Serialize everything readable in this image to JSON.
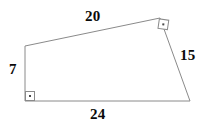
{
  "figure": {
    "kind": "quadrilateral-diagram",
    "canvas": {
      "width": 206,
      "height": 127,
      "background": "#ffffff"
    },
    "stroke_color": "#8a8a8a",
    "text_color": "#0a0a0a",
    "vertices": {
      "top_left": {
        "x": 25,
        "y": 46
      },
      "top_right": {
        "x": 160,
        "y": 18
      },
      "bottom_right": {
        "x": 190,
        "y": 101
      },
      "bottom_left": {
        "x": 25,
        "y": 101
      }
    },
    "labels": {
      "top": "20",
      "right": "15",
      "bottom": "24",
      "left": "7"
    },
    "right_angles": [
      {
        "at": "bottom_left",
        "style": "axis-aligned-square-with-dot"
      },
      {
        "at": "top_right",
        "style": "rotated-square-with-dot"
      }
    ]
  }
}
